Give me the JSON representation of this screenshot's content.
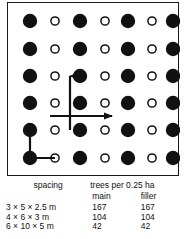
{
  "figure": {
    "diagram": {
      "description": "planting grid of main trees and filler trees",
      "rows": 6,
      "cols": 7,
      "pattern": [
        "main",
        "filler",
        "main",
        "filler",
        "main",
        "filler",
        "main"
      ],
      "main_marker": "filled-circle",
      "filler_marker": "open-circle",
      "main_color": "#111111",
      "filler_color": "#ffffff",
      "filler_stroke": "#111111",
      "axis_arrow_up": "vertical-spacing-arrow",
      "axis_arrow_right": "horizontal-spacing-arrow",
      "bracket": "diagonal-spacing-bracket"
    }
  },
  "table": {
    "headers": {
      "spacing": "spacing",
      "trees_per_area": "trees per 0.25 ha",
      "main": "main",
      "filler": "filler"
    },
    "rows": [
      {
        "spacing": "3 × 5 × 2.5 m",
        "main": "167",
        "filler": "167"
      },
      {
        "spacing": "4 × 6 × 3 m",
        "main": "104",
        "filler": "104"
      },
      {
        "spacing": "6 × 10 × 5 m",
        "main": "42",
        "filler": "42"
      }
    ]
  }
}
